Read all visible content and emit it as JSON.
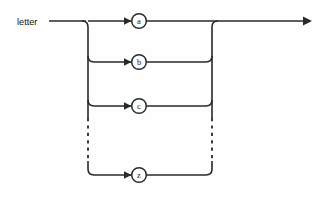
{
  "diagram": {
    "type": "railroad-syntax-diagram",
    "entry_label": "letter",
    "background_color": "#fefefe",
    "line_color": "#2a2a2a",
    "branches": [
      {
        "label": "a",
        "row": 1,
        "style": "solid"
      },
      {
        "label": "b",
        "row": 2,
        "style": "solid"
      },
      {
        "label": "c",
        "row": 3,
        "style": "solid"
      },
      {
        "label": "z",
        "row": 4,
        "style": "solid"
      }
    ],
    "ellipsis": {
      "style": "dashed",
      "meaning": "continuation of alternatives between c and z"
    },
    "exit": {
      "style": "arrow-right"
    }
  }
}
